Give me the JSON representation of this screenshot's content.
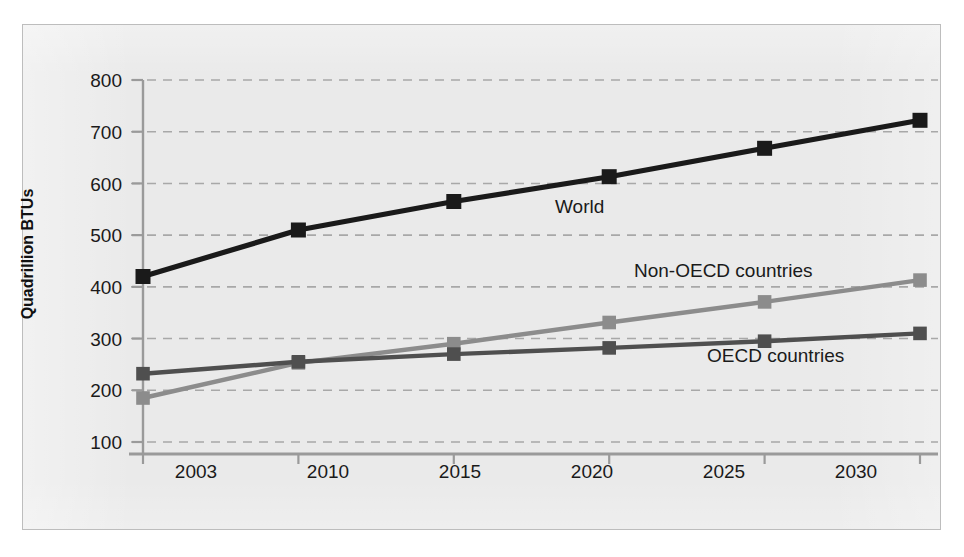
{
  "chart_data": {
    "type": "line",
    "title": "",
    "subtitle": "",
    "xlabel": "",
    "ylabel": "Quadrillion BTUs",
    "categories": [
      "2003",
      "2010",
      "2015",
      "2020",
      "2025",
      "2030"
    ],
    "ylim": [
      100,
      800
    ],
    "yticks": [
      "100",
      "200",
      "300",
      "400",
      "500",
      "600",
      "700",
      "800"
    ],
    "ytick_step": 100,
    "grid": true,
    "grid_style": "dashed-horizontal",
    "legend_position": "inline-annotations",
    "markers": "square",
    "series": [
      {
        "name": "World",
        "color": "#1a1a1a",
        "values": [
          420,
          510,
          565,
          613,
          668,
          722
        ]
      },
      {
        "name": "Non-OECD countries",
        "color": "#8c8c8c",
        "values": [
          185,
          253,
          290,
          331,
          371,
          413
        ]
      },
      {
        "name": "OECD countries",
        "color": "#4f4f4f",
        "values": [
          232,
          255,
          270,
          282,
          295,
          310
        ]
      }
    ],
    "annotations": [
      {
        "text": "World",
        "series": "World"
      },
      {
        "text": "Non-OECD countries",
        "series": "Non-OECD countries"
      },
      {
        "text": "OECD countries",
        "series": "OECD countries"
      }
    ],
    "colors": {
      "plot_background": "#eaeaea",
      "axis": "#9a9a9a",
      "gridline": "#a8a8a8",
      "text": "#1a1a1a"
    }
  },
  "axis": {
    "y_title": "Quadrillion BTUs",
    "y_ticks": [
      "800",
      "700",
      "600",
      "500",
      "400",
      "300",
      "200",
      "100"
    ],
    "x_ticks": [
      "2003",
      "2010",
      "2015",
      "2020",
      "2025",
      "2030"
    ]
  },
  "labels": {
    "world": "World",
    "non_oecd": "Non-OECD countries",
    "oecd": "OECD countries"
  }
}
